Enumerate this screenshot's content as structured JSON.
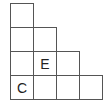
{
  "diagram": {
    "type": "staircase-grid",
    "line_color": "#555555",
    "cells": [
      {
        "row": 0,
        "col": 0,
        "label": ""
      },
      {
        "row": 1,
        "col": 0,
        "label": ""
      },
      {
        "row": 1,
        "col": 1,
        "label": ""
      },
      {
        "row": 2,
        "col": 0,
        "label": ""
      },
      {
        "row": 2,
        "col": 1,
        "label": "E"
      },
      {
        "row": 2,
        "col": 2,
        "label": ""
      },
      {
        "row": 3,
        "col": 0,
        "label": "C"
      },
      {
        "row": 3,
        "col": 1,
        "label": ""
      },
      {
        "row": 3,
        "col": 2,
        "label": ""
      },
      {
        "row": 3,
        "col": 3,
        "label": ""
      }
    ]
  }
}
